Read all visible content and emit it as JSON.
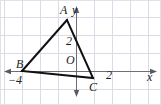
{
  "figure": {
    "kind": "coordinate-plane-triangle",
    "colors": {
      "grid": "#d8dce6",
      "axis": "#6e6e78",
      "triangle": "#111111",
      "label": "#1c1c1c",
      "background": "#ffffff",
      "border": "#e2e2e6"
    },
    "canvas": {
      "width": 161,
      "height": 105
    },
    "grid": {
      "visible": true,
      "spacing_px": 18,
      "x_lines": [
        4,
        22,
        40,
        58,
        76,
        94,
        112,
        130,
        148
      ],
      "y_lines": [
        -1,
        17,
        35,
        53,
        71,
        89
      ]
    },
    "axes": {
      "origin_px": {
        "x": 76,
        "y": 71
      },
      "unit_px": 18,
      "x_axis": {
        "label": "x",
        "arrow_left": true,
        "arrow_right": true,
        "ticks": [
          {
            "label": "−4",
            "value": -4
          },
          {
            "label": "2",
            "value": 2
          }
        ]
      },
      "y_axis": {
        "label": "y",
        "arrow_up": true,
        "arrow_down": true,
        "ticks": [
          {
            "label": "2",
            "value": 2
          }
        ]
      },
      "origin_label": "O"
    },
    "triangle": {
      "stroke_width": 2,
      "vertices": [
        {
          "name": "A",
          "label": "A",
          "x_units": -0.5,
          "y_units": 2.85,
          "px": {
            "x": 67,
            "y": 20
          }
        },
        {
          "name": "B",
          "label": "B",
          "x_units": -3.0,
          "y_units": 0.0,
          "px": {
            "x": 22,
            "y": 71
          }
        },
        {
          "name": "C",
          "label": "C",
          "x_units": 0.95,
          "y_units": -0.4,
          "px": {
            "x": 93,
            "y": 78
          }
        }
      ],
      "edges": [
        [
          "A",
          "B"
        ],
        [
          "B",
          "C"
        ],
        [
          "C",
          "A"
        ]
      ]
    }
  }
}
